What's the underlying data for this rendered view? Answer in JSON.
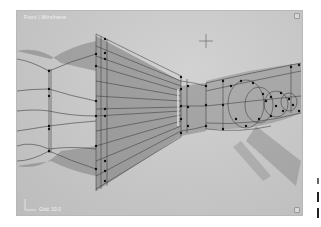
{
  "viewport": {
    "label": "Front | Wireframe",
    "bottom_label": "Grid: 10.0",
    "background_color": "#c8c8c8",
    "wire_color": "#3a3a3a",
    "vertex_color": "#111111",
    "cursor": "crosshair-icon"
  },
  "side_panel": {
    "marks": 3
  }
}
